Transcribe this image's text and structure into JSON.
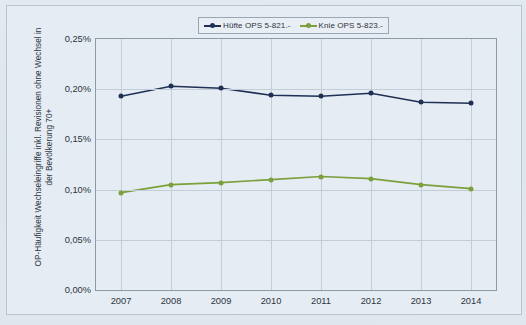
{
  "legend": {
    "position": "top-center",
    "entries": [
      {
        "label": "Hüfte OPS 5-821.-",
        "color": "#1f3055",
        "marker": "line-dot"
      },
      {
        "label": "Knie OPS 5-823.-",
        "color": "#7ba03c",
        "marker": "line-dot"
      }
    ]
  },
  "axes": {
    "y_title": "OP-Häufigkeit Wechseleingriffe inkl. Revisionen ohne Wechsel in der Bevölkerung 70+",
    "y_ticks": [
      "0,25%",
      "0,20%",
      "0,15%",
      "0,10%",
      "0,05%",
      "0,00%"
    ],
    "x_ticks": [
      "2007",
      "2008",
      "2009",
      "2010",
      "2011",
      "2012",
      "2013",
      "2014"
    ]
  },
  "chart_data": {
    "type": "line",
    "title": "",
    "xlabel": "",
    "ylabel": "OP-Häufigkeit Wechseleingriffe inkl. Revisionen ohne Wechsel in der Bevölkerung 70+",
    "categories": [
      "2007",
      "2008",
      "2009",
      "2010",
      "2011",
      "2012",
      "2013",
      "2014"
    ],
    "ylim": [
      0.0,
      0.25
    ],
    "ytick_values": [
      0.25,
      0.2,
      0.15,
      0.1,
      0.05,
      0.0
    ],
    "ytick_labels": [
      "0,25%",
      "0,20%",
      "0,15%",
      "0,10%",
      "0,05%",
      "0,00%"
    ],
    "unit": "%",
    "grid": "both",
    "legend_position": "top-center",
    "series": [
      {
        "name": "Hüfte OPS 5-821.-",
        "color": "#1f3055",
        "values": [
          0.193,
          0.203,
          0.201,
          0.194,
          0.193,
          0.196,
          0.187,
          0.186
        ]
      },
      {
        "name": "Knie OPS 5-823.-",
        "color": "#7ba03c",
        "values": [
          0.097,
          0.105,
          0.107,
          0.11,
          0.113,
          0.111,
          0.105,
          0.101
        ]
      }
    ]
  },
  "colors": {
    "hip": "#1f3055",
    "knee": "#7ba03c",
    "grid": "#c3cdd8",
    "frame": "#8d99a6",
    "text": "#2b3440",
    "page": "#e6ecf3"
  }
}
